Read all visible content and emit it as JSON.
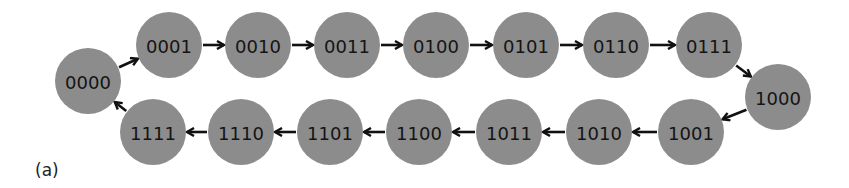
{
  "caption": "(a)",
  "colors": {
    "node_fill": "#8c8c8c",
    "label": "#141414",
    "edge": "#111111"
  },
  "nodes": [
    {
      "id": "0000",
      "label": "0000",
      "x": 88,
      "y": 81
    },
    {
      "id": "0001",
      "label": "0001",
      "x": 169,
      "y": 45
    },
    {
      "id": "0010",
      "label": "0010",
      "x": 258,
      "y": 45
    },
    {
      "id": "0011",
      "label": "0011",
      "x": 347,
      "y": 45
    },
    {
      "id": "0100",
      "label": "0100",
      "x": 436,
      "y": 45
    },
    {
      "id": "0101",
      "label": "0101",
      "x": 526,
      "y": 45
    },
    {
      "id": "0110",
      "label": "0110",
      "x": 616,
      "y": 45
    },
    {
      "id": "0111",
      "label": "0111",
      "x": 709,
      "y": 45
    },
    {
      "id": "1000",
      "label": "1000",
      "x": 778,
      "y": 97
    },
    {
      "id": "1001",
      "label": "1001",
      "x": 691,
      "y": 132
    },
    {
      "id": "1010",
      "label": "1010",
      "x": 599,
      "y": 132
    },
    {
      "id": "1011",
      "label": "1011",
      "x": 509,
      "y": 132
    },
    {
      "id": "1100",
      "label": "1100",
      "x": 419,
      "y": 132
    },
    {
      "id": "1101",
      "label": "1101",
      "x": 330,
      "y": 132
    },
    {
      "id": "1110",
      "label": "1110",
      "x": 241,
      "y": 132
    },
    {
      "id": "1111",
      "label": "1111",
      "x": 153,
      "y": 132
    }
  ],
  "edges": [
    [
      "0000",
      "0001"
    ],
    [
      "0001",
      "0010"
    ],
    [
      "0010",
      "0011"
    ],
    [
      "0011",
      "0100"
    ],
    [
      "0100",
      "0101"
    ],
    [
      "0101",
      "0110"
    ],
    [
      "0110",
      "0111"
    ],
    [
      "0111",
      "1000"
    ],
    [
      "1000",
      "1001"
    ],
    [
      "1001",
      "1010"
    ],
    [
      "1010",
      "1011"
    ],
    [
      "1011",
      "1100"
    ],
    [
      "1100",
      "1101"
    ],
    [
      "1101",
      "1110"
    ],
    [
      "1110",
      "1111"
    ],
    [
      "1111",
      "0000"
    ]
  ],
  "node_radius": 33
}
